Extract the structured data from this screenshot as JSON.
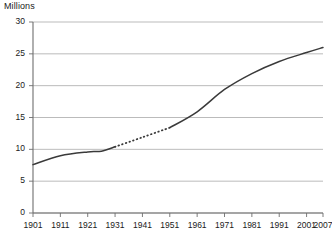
{
  "chart_data": {
    "type": "line",
    "title": "Millions",
    "xlabel": "",
    "ylabel": "Millions",
    "ylim": [
      0,
      30
    ],
    "xlim": [
      1901,
      2007
    ],
    "grid": true,
    "legend": "none",
    "y_ticks": [
      0,
      5,
      10,
      15,
      20,
      25,
      30
    ],
    "y_tick_labels": [
      "0",
      "5",
      "10",
      "15",
      "20",
      "25",
      "30"
    ],
    "x_ticks": [
      1901,
      1911,
      1921,
      1931,
      1941,
      1951,
      1961,
      1971,
      1981,
      1991,
      2001,
      2007
    ],
    "x_tick_labels": [
      "1901",
      "1911",
      "1921",
      "1931",
      "1941",
      "1951",
      "1961",
      "1971",
      "1981",
      "1991",
      "2001",
      "2007"
    ],
    "series": [
      {
        "name": "Population",
        "style": "solid",
        "color": "#3a3a3a",
        "x": [
          1901,
          1911,
          1921,
          1926,
          1931
        ],
        "values": [
          7.6,
          9.0,
          9.6,
          9.7,
          10.4
        ]
      },
      {
        "name": "Population (estimated)",
        "style": "dotted",
        "color": "#3a3a3a",
        "x": [
          1931,
          1941,
          1951
        ],
        "values": [
          10.4,
          11.9,
          13.4
        ]
      },
      {
        "name": "Population (continued)",
        "style": "solid",
        "color": "#3a3a3a",
        "x": [
          1951,
          1961,
          1971,
          1981,
          1991,
          2001,
          2007
        ],
        "values": [
          13.4,
          15.9,
          19.4,
          21.9,
          23.8,
          25.2,
          26.0
        ]
      }
    ],
    "annotations": [
      {
        "text": "dotted segment denotes interpolated values 1931-1951"
      }
    ],
    "colors": {
      "line": "#3a3a3a",
      "gridline": "#aaaaaa",
      "axis": "#6e6e6e",
      "text": "#1a1a1a",
      "background": "#ffffff"
    }
  }
}
